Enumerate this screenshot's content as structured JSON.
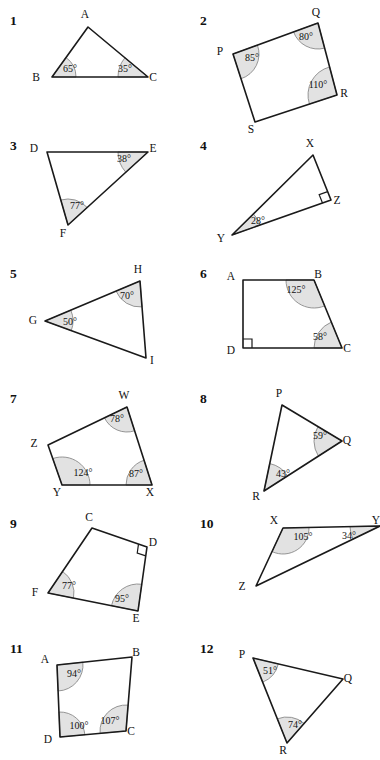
{
  "page": {
    "width": 380,
    "height": 760,
    "background": "#ffffff",
    "ink_color": "#1a1a1a",
    "arc_fill_color": "#e2e2e2",
    "arc_stroke_color": "#8a8a8a"
  },
  "problems": [
    {
      "number": "1",
      "shape": "triangle",
      "vertices": [
        {
          "label": "A",
          "x": 88,
          "y": 22,
          "lx": 85,
          "ly": 13
        },
        {
          "label": "B",
          "x": 52,
          "y": 72,
          "lx": 36,
          "ly": 76
        },
        {
          "label": "C",
          "x": 148,
          "y": 72,
          "lx": 153,
          "ly": 76
        }
      ],
      "angles": [
        {
          "at": "B",
          "value": "65°",
          "lx": 70,
          "ly": 67,
          "r": 24
        },
        {
          "at": "C",
          "value": "35°",
          "lx": 125,
          "ly": 67,
          "r": 30
        }
      ],
      "right_angles": []
    },
    {
      "number": "2",
      "shape": "quadrilateral",
      "vertices": [
        {
          "label": "P",
          "x": 43,
          "y": 49,
          "lx": 30,
          "ly": 50
        },
        {
          "label": "Q",
          "x": 128,
          "y": 18,
          "lx": 126,
          "ly": 11
        },
        {
          "label": "R",
          "x": 147,
          "y": 90,
          "lx": 154,
          "ly": 92
        },
        {
          "label": "S",
          "x": 65,
          "y": 117,
          "lx": 61,
          "ly": 128
        }
      ],
      "angles": [
        {
          "at": "P",
          "value": "85°",
          "lx": 62,
          "ly": 56,
          "r": 26
        },
        {
          "at": "Q",
          "value": "80°",
          "lx": 116,
          "ly": 35,
          "r": 26
        },
        {
          "at": "R",
          "value": "110°",
          "lx": 128,
          "ly": 83,
          "r": 29
        }
      ],
      "right_angles": []
    },
    {
      "number": "3",
      "shape": "triangle",
      "vertices": [
        {
          "label": "D",
          "x": 47,
          "y": 22,
          "lx": 34,
          "ly": 22
        },
        {
          "label": "E",
          "x": 148,
          "y": 22,
          "lx": 153,
          "ly": 22
        },
        {
          "label": "F",
          "x": 68,
          "y": 95,
          "lx": 63,
          "ly": 107
        }
      ],
      "angles": [
        {
          "at": "E",
          "value": "38°",
          "lx": 124,
          "ly": 32,
          "r": 30
        },
        {
          "at": "F",
          "value": "77°",
          "lx": 77,
          "ly": 79,
          "r": 26
        }
      ],
      "right_angles": []
    },
    {
      "number": "4",
      "shape": "triangle",
      "vertices": [
        {
          "label": "X",
          "x": 123,
          "y": 25,
          "lx": 120,
          "ly": 17
        },
        {
          "label": "Y",
          "x": 42,
          "y": 105,
          "lx": 31,
          "ly": 112
        },
        {
          "label": "Z",
          "x": 141,
          "y": 70,
          "lx": 147,
          "ly": 74
        }
      ],
      "angles": [
        {
          "at": "Y",
          "value": "28°",
          "lx": 68,
          "ly": 94,
          "r": 30
        }
      ],
      "right_angles": [
        {
          "at": "Z",
          "size": 9
        }
      ]
    },
    {
      "number": "5",
      "shape": "triangle",
      "vertices": [
        {
          "label": "G",
          "x": 45,
          "y": 63,
          "lx": 33,
          "ly": 66
        },
        {
          "label": "H",
          "x": 140,
          "y": 23,
          "lx": 138,
          "ly": 15
        },
        {
          "label": "I",
          "x": 146,
          "y": 100,
          "lx": 152,
          "ly": 106
        }
      ],
      "angles": [
        {
          "at": "G",
          "value": "50°",
          "lx": 70,
          "ly": 67,
          "r": 28
        },
        {
          "at": "H",
          "value": "70°",
          "lx": 127,
          "ly": 41,
          "r": 26
        }
      ],
      "right_angles": []
    },
    {
      "number": "6",
      "shape": "quadrilateral",
      "vertices": [
        {
          "label": "A",
          "x": 53,
          "y": 22,
          "lx": 41,
          "ly": 22
        },
        {
          "label": "B",
          "x": 124,
          "y": 22,
          "lx": 128,
          "ly": 20
        },
        {
          "label": "C",
          "x": 152,
          "y": 90,
          "lx": 157,
          "ly": 94
        },
        {
          "label": "D",
          "x": 53,
          "y": 90,
          "lx": 41,
          "ly": 96
        }
      ],
      "angles": [
        {
          "at": "B",
          "value": "125°",
          "lx": 106,
          "ly": 35,
          "r": 28
        },
        {
          "at": "C",
          "value": "58°",
          "lx": 130,
          "ly": 82,
          "r": 28
        }
      ],
      "right_angles": [
        {
          "at": "D",
          "size": 9
        }
      ]
    },
    {
      "number": "7",
      "shape": "quadrilateral",
      "vertices": [
        {
          "label": "W",
          "x": 127,
          "y": 24,
          "lx": 124,
          "ly": 16
        },
        {
          "label": "X",
          "x": 152,
          "y": 102,
          "lx": 150,
          "ly": 113
        },
        {
          "label": "Y",
          "x": 62,
          "y": 102,
          "lx": 57,
          "ly": 113
        },
        {
          "label": "Z",
          "x": 48,
          "y": 62,
          "lx": 34,
          "ly": 64
        }
      ],
      "angles": [
        {
          "at": "W",
          "value": "78°",
          "lx": 117,
          "ly": 39,
          "r": 25
        },
        {
          "at": "X",
          "value": "87°",
          "lx": 136,
          "ly": 94,
          "r": 26
        },
        {
          "at": "Y",
          "value": "124°",
          "lx": 83,
          "ly": 93,
          "r": 28
        }
      ],
      "right_angles": []
    },
    {
      "number": "8",
      "shape": "triangle",
      "vertices": [
        {
          "label": "P",
          "x": 92,
          "y": 22,
          "lx": 89,
          "ly": 14
        },
        {
          "label": "Q",
          "x": 152,
          "y": 58,
          "lx": 157,
          "ly": 61
        },
        {
          "label": "R",
          "x": 74,
          "y": 108,
          "lx": 66,
          "ly": 117
        }
      ],
      "angles": [
        {
          "at": "Q",
          "value": "59°",
          "lx": 130,
          "ly": 56,
          "r": 28
        },
        {
          "at": "R",
          "value": "43°",
          "lx": 93,
          "ly": 94,
          "r": 28
        }
      ],
      "right_angles": []
    },
    {
      "number": "9",
      "shape": "quadrilateral",
      "vertices": [
        {
          "label": "C",
          "x": 92,
          "y": 20,
          "lx": 89,
          "ly": 13
        },
        {
          "label": "D",
          "x": 147,
          "y": 39,
          "lx": 153,
          "ly": 38
        },
        {
          "label": "E",
          "x": 138,
          "y": 103,
          "lx": 136,
          "ly": 114
        },
        {
          "label": "F",
          "x": 48,
          "y": 85,
          "lx": 35,
          "ly": 88
        }
      ],
      "angles": [
        {
          "at": "F",
          "value": "77°",
          "lx": 69,
          "ly": 81,
          "r": 26
        },
        {
          "at": "E",
          "value": "95°",
          "lx": 122,
          "ly": 94,
          "r": 27
        }
      ],
      "right_angles": [
        {
          "at": "D",
          "size": 9
        }
      ]
    },
    {
      "number": "10",
      "shape": "triangle",
      "vertices": [
        {
          "label": "X",
          "x": 93,
          "y": 20,
          "lx": 84,
          "ly": 16
        },
        {
          "label": "Y",
          "x": 190,
          "y": 18,
          "lx": 186,
          "ly": 16
        },
        {
          "label": "Z",
          "x": 66,
          "y": 78,
          "lx": 52,
          "ly": 82
        }
      ],
      "angles": [
        {
          "at": "X",
          "value": "105°",
          "lx": 113,
          "ly": 32,
          "r": 26
        },
        {
          "at": "Y",
          "value": "34°",
          "lx": 159,
          "ly": 31,
          "r": 30
        }
      ],
      "right_angles": []
    },
    {
      "number": "11",
      "shape": "quadrilateral",
      "vertices": [
        {
          "label": "A",
          "x": 57,
          "y": 32,
          "lx": 45,
          "ly": 30
        },
        {
          "label": "B",
          "x": 132,
          "y": 24,
          "lx": 136,
          "ly": 23
        },
        {
          "label": "C",
          "x": 126,
          "y": 98,
          "lx": 131,
          "ly": 102
        },
        {
          "label": "D",
          "x": 60,
          "y": 104,
          "lx": 48,
          "ly": 110
        }
      ],
      "angles": [
        {
          "at": "A",
          "value": "94°",
          "lx": 74,
          "ly": 44,
          "r": 26
        },
        {
          "at": "C",
          "value": "107°",
          "lx": 110,
          "ly": 91,
          "r": 26
        },
        {
          "at": "D",
          "value": "100°",
          "lx": 79,
          "ly": 96,
          "r": 25
        }
      ],
      "right_angles": []
    },
    {
      "number": "12",
      "shape": "triangle",
      "vertices": [
        {
          "label": "P",
          "x": 63,
          "y": 25,
          "lx": 52,
          "ly": 25
        },
        {
          "label": "Q",
          "x": 153,
          "y": 46,
          "lx": 158,
          "ly": 49
        },
        {
          "label": "R",
          "x": 97,
          "y": 110,
          "lx": 93,
          "ly": 121
        }
      ],
      "angles": [
        {
          "at": "P",
          "value": "51°",
          "lx": 80,
          "ly": 41,
          "r": 26
        },
        {
          "at": "R",
          "value": "74°",
          "lx": 105,
          "ly": 95,
          "r": 26
        }
      ],
      "right_angles": []
    }
  ],
  "layout": {
    "columns": 2,
    "rows": 6,
    "col_x": [
      0,
      190
    ],
    "row_y": [
      5,
      130,
      258,
      383,
      508,
      633
    ],
    "number_offset": {
      "x": 10,
      "y": 8
    }
  }
}
